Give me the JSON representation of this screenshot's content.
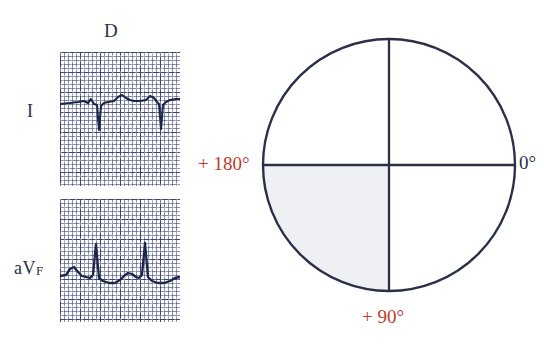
{
  "figure": {
    "type": "ecg-axis-figure"
  },
  "ecg": {
    "column_header": "D",
    "strips": [
      {
        "id": "lead-i",
        "label": "I",
        "label_plain": "I",
        "polarity": "negative",
        "qrs_direction": "downward",
        "description": "Lead I / D: predominantly negative QRS complexes with deep S waves",
        "trace_path": "M0,52 L10,51 L18,50 L24,49 L28,51 L31,47 L34,52 L37,53 L39,78 L41,54 L44,51 L48,50 L54,49 L58,45 L62,43 L66,46 L70,48 L74,49 L80,49 L86,48 L90,44 L94,46 L97,50 L99,52 L101,77 L103,53 L106,50 L110,48 L116,47 L120,47",
        "paper": {
          "small_box_px": 4,
          "large_box_px": 20,
          "grid_color": "#242e54"
        }
      },
      {
        "id": "lead-avf",
        "label_prefix": "aV",
        "label_suffix": "F",
        "label_plain": "aVF",
        "polarity": "positive",
        "qrs_direction": "upward",
        "description": "Lead aVF: predominantly positive QRS complexes with tall R waves",
        "trace_path": "M0,77 L6,76 L10,70 L14,68 L18,73 L22,77 L26,78 L30,79 L33,76 L36,45 L39,79 L43,82 L49,84 L55,84 L60,81 L64,77 L68,74 L72,75 L76,78 L79,79 L82,76 L85,44 L88,78 L92,82 L98,84 L104,84 L110,82 L115,79 L120,78",
        "paper": {
          "small_box_px": 4,
          "large_box_px": 20,
          "grid_color": "#242e54"
        }
      }
    ]
  },
  "circle": {
    "name": "hexaxial-reference-circle",
    "outline_color": "#2b3048",
    "shaded_quadrant": {
      "name": "right-axis-deviation-quadrant",
      "position": "bottom-left",
      "from_degrees": "+90",
      "to_degrees": "+180",
      "fill_color": "#eef0f3"
    },
    "labels": [
      {
        "id": "deg-180",
        "text": "+ 180°",
        "color": "#c0392f",
        "position": "left"
      },
      {
        "id": "deg-0",
        "text": "0°",
        "color": "#2b3048",
        "position": "right"
      },
      {
        "id": "deg-90",
        "text": "+ 90°",
        "color": "#c0392f",
        "position": "bottom"
      }
    ],
    "axes": {
      "horizontal": "0° to +180°",
      "vertical": "-90° to +90°"
    }
  },
  "colors": {
    "ink": "#2b3048",
    "red": "#c0392f",
    "grid": "#242e54",
    "shade": "#eef0f3",
    "paper": "#ffffff"
  }
}
